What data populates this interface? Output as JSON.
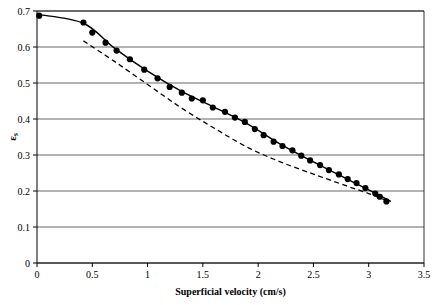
{
  "chart_data": {
    "type": "scatter",
    "title": "",
    "xlabel": "Superficial velocity (cm/s)",
    "ylabel": "εs",
    "xlim": [
      0,
      3.5
    ],
    "ylim": [
      0,
      0.7
    ],
    "xticks": [
      "0",
      "0.5",
      "1",
      "1.5",
      "2",
      "2.5",
      "3",
      "3.5"
    ],
    "yticks": [
      "0",
      "0.1",
      "0.2",
      "0.3",
      "0.4",
      "0.5",
      "0.6",
      "0.7"
    ],
    "grid": "horizontal",
    "legend": "none",
    "series": [
      {
        "name": "experimental data",
        "type": "scatter",
        "marker": "filled-circle",
        "color": "#000000",
        "points": [
          [
            0.02,
            0.687
          ],
          [
            0.42,
            0.668
          ],
          [
            0.5,
            0.64
          ],
          [
            0.62,
            0.612
          ],
          [
            0.72,
            0.59
          ],
          [
            0.84,
            0.566
          ],
          [
            0.97,
            0.537
          ],
          [
            1.09,
            0.513
          ],
          [
            1.2,
            0.489
          ],
          [
            1.31,
            0.473
          ],
          [
            1.4,
            0.457
          ],
          [
            1.5,
            0.452
          ],
          [
            1.59,
            0.432
          ],
          [
            1.7,
            0.42
          ],
          [
            1.79,
            0.404
          ],
          [
            1.88,
            0.392
          ],
          [
            1.97,
            0.372
          ],
          [
            2.05,
            0.355
          ],
          [
            2.14,
            0.337
          ],
          [
            2.22,
            0.325
          ],
          [
            2.31,
            0.313
          ],
          [
            2.39,
            0.298
          ],
          [
            2.47,
            0.285
          ],
          [
            2.56,
            0.272
          ],
          [
            2.64,
            0.258
          ],
          [
            2.73,
            0.246
          ],
          [
            2.81,
            0.233
          ],
          [
            2.89,
            0.222
          ],
          [
            2.97,
            0.208
          ],
          [
            3.06,
            0.193
          ],
          [
            3.1,
            0.184
          ],
          [
            3.16,
            0.171
          ]
        ]
      },
      {
        "name": "model fit",
        "type": "line",
        "style": "solid",
        "color": "#000000",
        "points": [
          [
            0.02,
            0.69
          ],
          [
            0.42,
            0.666
          ],
          [
            0.7,
            0.597
          ],
          [
            1.0,
            0.533
          ],
          [
            1.3,
            0.478
          ],
          [
            1.6,
            0.433
          ],
          [
            1.9,
            0.387
          ],
          [
            2.2,
            0.33
          ],
          [
            2.5,
            0.281
          ],
          [
            2.8,
            0.234
          ],
          [
            3.0,
            0.203
          ],
          [
            3.2,
            0.171
          ]
        ]
      },
      {
        "name": "second model",
        "type": "line",
        "style": "dashed",
        "color": "#000000",
        "points": [
          [
            0.42,
            0.617
          ],
          [
            0.7,
            0.56
          ],
          [
            1.0,
            0.496
          ],
          [
            1.3,
            0.432
          ],
          [
            1.6,
            0.375
          ],
          [
            1.9,
            0.322
          ],
          [
            2.2,
            0.281
          ],
          [
            2.5,
            0.247
          ],
          [
            2.8,
            0.214
          ],
          [
            3.0,
            0.193
          ],
          [
            3.15,
            0.175
          ]
        ]
      }
    ]
  }
}
